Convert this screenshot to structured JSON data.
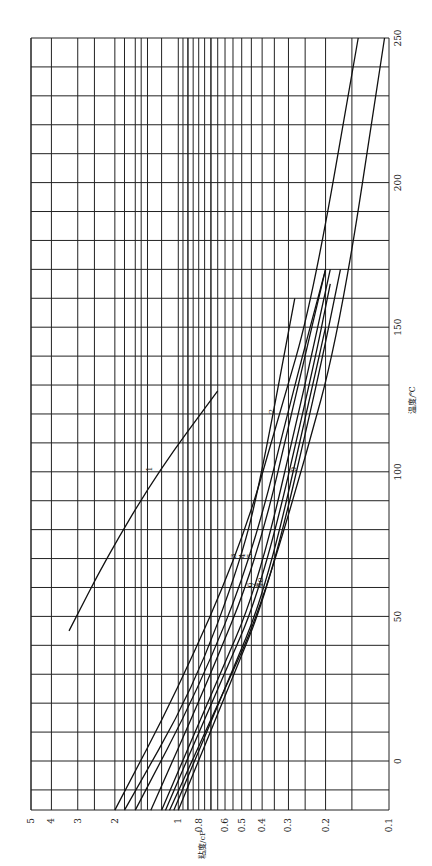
{
  "chart_data": {
    "type": "line",
    "title": "",
    "orientation": "rotated-90-ccw",
    "xlabel": "温度/℃",
    "ylabel": "粘度/cP",
    "xlim": [
      -17,
      250
    ],
    "ylim": [
      0.1,
      5
    ],
    "yscale": "log",
    "grid": true,
    "x_ticks": [
      0,
      50,
      100,
      150,
      200,
      250
    ],
    "y_ticks": [
      0.1,
      0.2,
      0.3,
      0.4,
      0.5,
      0.6,
      0.8,
      1,
      2,
      3,
      4,
      5
    ],
    "series": [
      {
        "name": "1",
        "points": [
          [
            45,
            3.3
          ],
          [
            70,
            2.2
          ],
          [
            100,
            1.25
          ],
          [
            128,
            0.65
          ]
        ]
      },
      {
        "name": "2",
        "points": [
          [
            -17,
            2.0
          ],
          [
            25,
            1.0
          ],
          [
            75,
            0.5
          ],
          [
            120,
            0.33
          ],
          [
            160,
            0.23
          ],
          [
            250,
            0.14
          ]
        ]
      },
      {
        "name": "3",
        "points": [
          [
            -17,
            1.8
          ],
          [
            25,
            0.85
          ],
          [
            70,
            0.5
          ],
          [
            100,
            0.4
          ],
          [
            160,
            0.28
          ]
        ]
      },
      {
        "name": "4",
        "points": [
          [
            -17,
            1.6
          ],
          [
            25,
            0.8
          ],
          [
            70,
            0.45
          ],
          [
            130,
            0.28
          ],
          [
            170,
            0.2
          ]
        ]
      },
      {
        "name": "5",
        "points": [
          [
            -17,
            1.35
          ],
          [
            25,
            0.75
          ],
          [
            70,
            0.42
          ],
          [
            130,
            0.27
          ],
          [
            170,
            0.2
          ]
        ]
      },
      {
        "name": "6",
        "points": [
          [
            -17,
            1.2
          ],
          [
            25,
            0.68
          ],
          [
            60,
            0.42
          ],
          [
            130,
            0.25
          ],
          [
            170,
            0.19
          ]
        ]
      },
      {
        "name": "7",
        "points": [
          [
            -17,
            1.15
          ],
          [
            25,
            0.65
          ],
          [
            60,
            0.4
          ],
          [
            135,
            0.23
          ],
          [
            165,
            0.19
          ]
        ]
      },
      {
        "name": "8",
        "points": [
          [
            -17,
            1.05
          ],
          [
            25,
            0.6
          ],
          [
            60,
            0.38
          ],
          [
            130,
            0.23
          ],
          [
            150,
            0.2
          ]
        ]
      },
      {
        "name": "9",
        "points": [
          [
            -17,
            1.1
          ],
          [
            25,
            0.6
          ],
          [
            50,
            0.42
          ],
          [
            100,
            0.26
          ],
          [
            150,
            0.17
          ],
          [
            250,
            0.105
          ]
        ]
      },
      {
        "name": "10",
        "points": [
          [
            -17,
            1.0
          ],
          [
            25,
            0.58
          ],
          [
            60,
            0.37
          ],
          [
            130,
            0.22
          ],
          [
            170,
            0.17
          ]
        ]
      }
    ]
  },
  "axis": {
    "x_title": "温度/℃",
    "y_title": "粘度/cP",
    "x_tick_labels": [
      "0",
      "50",
      "100",
      "150",
      "200",
      "250"
    ],
    "y_tick_labels": [
      "5",
      "4",
      "3",
      "2",
      "1",
      "0.8",
      "0.6",
      "0.5",
      "0.4",
      "0.3",
      "0.2",
      "0.1"
    ]
  }
}
